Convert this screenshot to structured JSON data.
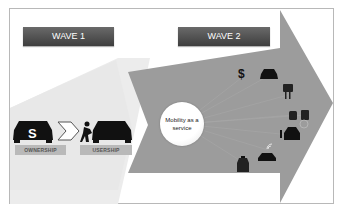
{
  "diagram": {
    "wave1": {
      "label": "WAVE 1"
    },
    "wave2": {
      "label": "WAVE 2"
    },
    "ownership": {
      "label": "OWNERSHIP"
    },
    "usership": {
      "label": "USERSHIP"
    },
    "center": {
      "label": "Mobility as a service"
    },
    "dollar_symbol": "$",
    "icons": [
      "car-with-dollar-icon",
      "chevron-right-icon",
      "person-pushing-car-icon",
      "dollar-icon",
      "car-icon",
      "parking-meter-icon",
      "bus-icon",
      "train-icon",
      "person-with-car-icon",
      "connected-car-icon",
      "taxi-icon"
    ],
    "colors": {
      "wave1_arrow": "#ececec",
      "wave2_arrow": "#9c9c9c",
      "label_bg": "#4a4a4a",
      "tag_bg": "#b9b9b9"
    }
  }
}
